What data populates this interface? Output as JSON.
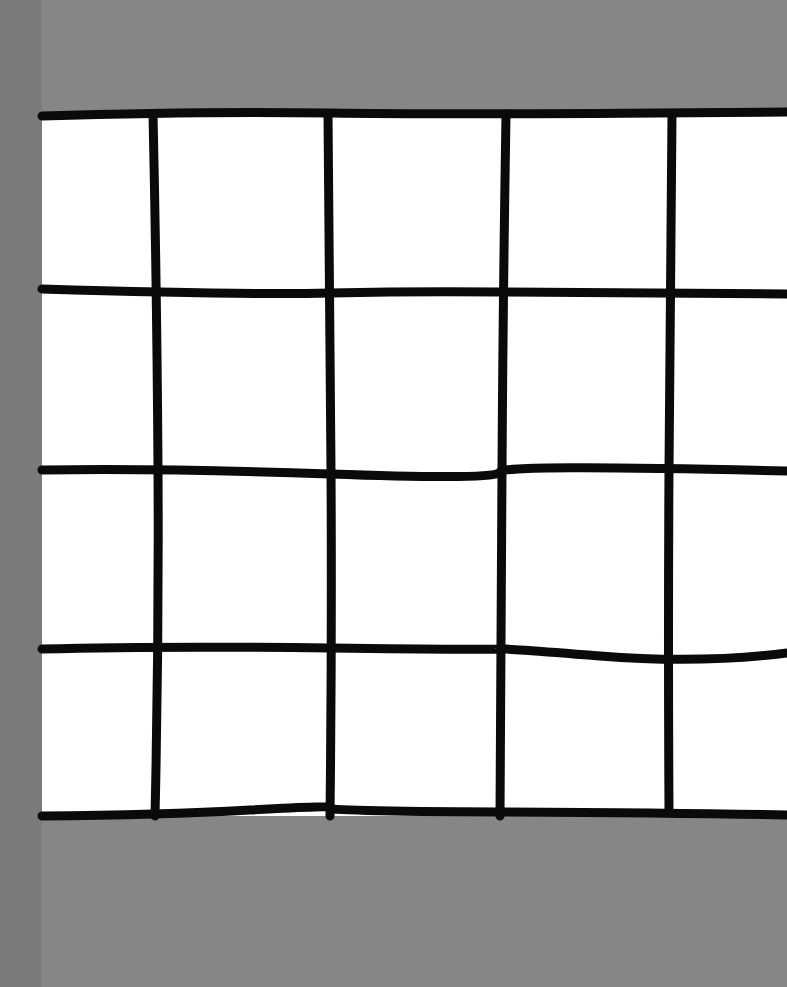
{
  "scene": {
    "description": "Hand-drawn black grid of lines on white paper over gray background",
    "colors": {
      "background": "#868686",
      "left_strip": "#7b7b7b",
      "paper": "#ffffff",
      "line": "#0a0a0a"
    },
    "grid": {
      "columns_visible": 5,
      "rows": 4,
      "vertical_lines_x": [
        155,
        328,
        503,
        670
      ],
      "horizontal_lines_y": [
        114,
        290,
        470,
        648,
        815
      ]
    }
  }
}
